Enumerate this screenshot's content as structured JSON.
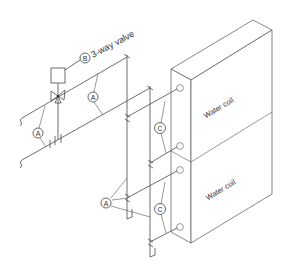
{
  "diagram": {
    "valve_label": "3-way valve",
    "tags": {
      "A": "A",
      "B": "B",
      "C": "C"
    },
    "coils": [
      {
        "label": "Water coil"
      },
      {
        "label": "Water coil"
      }
    ],
    "colors": {
      "line": "#4a4a4a",
      "background": "#ffffff",
      "text": "#333333"
    }
  }
}
